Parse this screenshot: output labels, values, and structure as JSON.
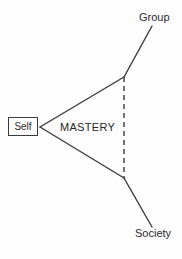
{
  "diagram": {
    "title_text": "MASTERY",
    "type": "concept-diagram",
    "background_color": "#fdfdfd",
    "line_color": "#3a3a3a",
    "text_color": "#2b2b2b",
    "nodes": {
      "self": {
        "label": "Self",
        "shape": "rectangle",
        "x": 8,
        "y": 117,
        "width": 30,
        "height": 19
      },
      "group": {
        "label": "Group",
        "shape": "text",
        "x": 139,
        "y": 12
      },
      "society": {
        "label": "Society",
        "shape": "text",
        "x": 135,
        "y": 228
      },
      "center": {
        "label": "MASTERY",
        "shape": "text",
        "x": 60,
        "y": 122
      }
    },
    "edges": [
      {
        "name": "self-to-group-vertex",
        "style": "solid",
        "from": [
          40,
          127
        ],
        "to": [
          124,
          77
        ]
      },
      {
        "name": "self-to-society-vertex",
        "style": "solid",
        "from": [
          40,
          127
        ],
        "to": [
          124,
          178
        ]
      },
      {
        "name": "group-vertex-to-group",
        "style": "solid",
        "from": [
          124,
          77
        ],
        "to": [
          152,
          26
        ]
      },
      {
        "name": "society-vertex-to-society",
        "style": "solid",
        "from": [
          124,
          178
        ],
        "to": [
          152,
          227
        ]
      },
      {
        "name": "group-society-connector",
        "style": "dashed",
        "from": [
          124,
          77
        ],
        "to": [
          124,
          178
        ],
        "dash_pattern": "5 4"
      }
    ]
  }
}
